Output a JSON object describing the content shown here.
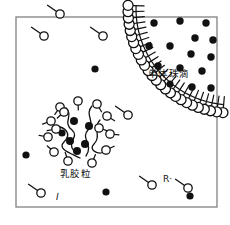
{
  "figure": {
    "type": "diagram",
    "top_strip_text": "· · · · · · · · · · ·",
    "frame": {
      "x": 16,
      "y": 17,
      "width": 201,
      "height": 190,
      "stroke": "#8a8a8a",
      "stroke_width": 1.4
    },
    "palette": {
      "ink": "#111111",
      "frame": "#8a8a8a",
      "fill_white": "#ffffff",
      "monomer_dot": "#000000",
      "background": "#ffffff"
    }
  },
  "labels": {
    "monomer_droplet": "单体珠滴",
    "latex_particle": "乳胶粒",
    "initiator": "I",
    "radical": "R·"
  },
  "legend_semantics": {
    "open_circle_with_tail": "surfactant / emulsifier molecule",
    "filled_dot": "monomer molecule",
    "arc_of_circles": "monomer droplet interface stabilized by surfactant",
    "cluster": "latex particle (micelle swollen with monomer)"
  },
  "droplet": {
    "center_x": 232,
    "center_y": 9,
    "radius_inner": 96,
    "radius_head": 104,
    "head_radius": 5.0,
    "tail_length": 11,
    "count": 26,
    "angle_start_deg": 95,
    "angle_end_deg": 182
  },
  "droplet_monomers": [
    {
      "x": 154,
      "y": 23,
      "r": 3.7
    },
    {
      "x": 180,
      "y": 21,
      "r": 3.7
    },
    {
      "x": 206,
      "y": 23,
      "r": 3.7
    },
    {
      "x": 195,
      "y": 38,
      "r": 3.7
    },
    {
      "x": 213,
      "y": 40,
      "r": 3.7
    },
    {
      "x": 149,
      "y": 46,
      "r": 3.7
    },
    {
      "x": 170,
      "y": 46,
      "r": 3.7
    },
    {
      "x": 191,
      "y": 54,
      "r": 3.7
    },
    {
      "x": 211,
      "y": 57,
      "r": 3.7
    },
    {
      "x": 158,
      "y": 66,
      "r": 3.7
    },
    {
      "x": 180,
      "y": 68,
      "r": 3.7
    },
    {
      "x": 202,
      "y": 71,
      "r": 3.7
    },
    {
      "x": 192,
      "y": 87,
      "r": 3.7
    },
    {
      "x": 211,
      "y": 88,
      "r": 3.7
    },
    {
      "x": 170,
      "y": 84,
      "r": 3.5
    }
  ],
  "free_monomers": [
    {
      "x": 95,
      "y": 69,
      "r": 3.6
    },
    {
      "x": 26,
      "y": 155,
      "r": 3.6
    },
    {
      "x": 106,
      "y": 192,
      "r": 3.6
    },
    {
      "x": 190,
      "y": 196,
      "r": 3.6
    }
  ],
  "free_surfactants": [
    {
      "x": 44,
      "y": 36,
      "angle_deg": 215,
      "head_r": 4.2,
      "tail": 11
    },
    {
      "x": 103,
      "y": 36,
      "angle_deg": 215,
      "head_r": 4.2,
      "tail": 11
    },
    {
      "x": 128,
      "y": 115,
      "angle_deg": 215,
      "head_r": 4.2,
      "tail": 11
    },
    {
      "x": 60,
      "y": 14,
      "angle_deg": 215,
      "head_r": 4.2,
      "tail": 11
    },
    {
      "x": 41,
      "y": 193,
      "angle_deg": 215,
      "head_r": 4.2,
      "tail": 11
    },
    {
      "x": 152,
      "y": 185,
      "angle_deg": 215,
      "head_r": 4.2,
      "tail": 11
    },
    {
      "x": 188,
      "y": 188,
      "angle_deg": 215,
      "head_r": 4.2,
      "tail": 11
    }
  ],
  "latex_particle": {
    "center_x": 81,
    "center_y": 131,
    "radius": 31,
    "surfactant_heads": [
      {
        "x": 78,
        "y": 101,
        "a": 268
      },
      {
        "x": 60,
        "y": 107,
        "a": 305
      },
      {
        "x": 97,
        "y": 104,
        "a": 240
      },
      {
        "x": 51,
        "y": 121,
        "a": 340
      },
      {
        "x": 107,
        "y": 116,
        "a": 212
      },
      {
        "x": 48,
        "y": 137,
        "a": 10
      },
      {
        "x": 110,
        "y": 134,
        "a": 185
      },
      {
        "x": 54,
        "y": 152,
        "a": 42
      },
      {
        "x": 106,
        "y": 150,
        "a": 155
      },
      {
        "x": 68,
        "y": 161,
        "a": 72
      },
      {
        "x": 92,
        "y": 163,
        "a": 112
      },
      {
        "x": 64,
        "y": 112,
        "a": 318
      },
      {
        "x": 99,
        "y": 128,
        "a": 198
      },
      {
        "x": 56,
        "y": 129,
        "a": 350
      }
    ],
    "monomers": [
      {
        "x": 74,
        "y": 121,
        "r": 4.0
      },
      {
        "x": 89,
        "y": 126,
        "r": 4.0
      },
      {
        "x": 70,
        "y": 141,
        "r": 4.0
      },
      {
        "x": 85,
        "y": 144,
        "r": 4.0
      },
      {
        "x": 77,
        "y": 151,
        "r": 4.0
      },
      {
        "x": 62,
        "y": 133,
        "r": 3.6
      }
    ]
  }
}
